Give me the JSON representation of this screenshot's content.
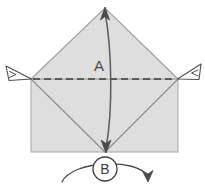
{
  "figure": {
    "type": "origami-fold-diagram",
    "title": "",
    "background_color": "#ffffff",
    "paper_fill": "#dedede",
    "paper_stroke": "#9a9a9a",
    "line_color": "#5a5a5a",
    "dashed_line_color": "#3c3c3c",
    "label_color": "#4a4a4a"
  },
  "labels": {
    "point_a": "A",
    "point_b": "B"
  },
  "annotations": {
    "left_pointer_name": "left-corner-pointer",
    "right_pointer_name": "right-corner-pointer",
    "fold_arrow_name": "vertical-double-arrow",
    "rotate_arrow_name": "rotate-arc-arrow"
  },
  "geometry": {
    "rect": {
      "x": 31,
      "y": 79,
      "width": 147,
      "height": 73
    },
    "apex": {
      "x": 105,
      "y": 8
    },
    "left_corner": {
      "x": 31,
      "y": 79
    },
    "right_corner": {
      "x": 178,
      "y": 79
    },
    "bottom_center": {
      "x": 105,
      "y": 152
    },
    "dashed_line_y": 79,
    "b_circle": {
      "cx": 105,
      "cy": 169,
      "r": 12
    }
  }
}
